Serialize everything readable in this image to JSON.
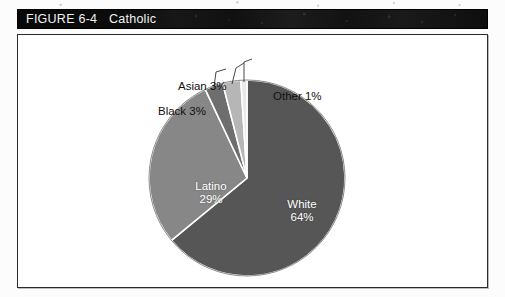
{
  "header": {
    "figure_number": "FIGURE 6-4",
    "figure_title": "Catholic",
    "bar_color": "#101010",
    "text_color": "#f2f2f2"
  },
  "frame": {
    "background": "#ffffff",
    "border_color": "#2b2b2b"
  },
  "chart_data": {
    "type": "pie",
    "title": "Catholic",
    "xlabel": "",
    "ylabel": "",
    "categories": [
      "White",
      "Latino",
      "Black",
      "Asian",
      "Other"
    ],
    "values": [
      64,
      29,
      3,
      3,
      1
    ],
    "unit": "percent",
    "legend": "none",
    "grid": false,
    "start_angle_deg": 0,
    "direction": "clockwise",
    "slices": [
      {
        "name": "White",
        "label": "White",
        "value_label": "64%",
        "value": 64,
        "color": "#565656",
        "label_position": "inside",
        "label_color": "#ffffff"
      },
      {
        "name": "Latino",
        "label": "Latino",
        "value_label": "29%",
        "value": 29,
        "color": "#878787",
        "label_position": "inside",
        "label_color": "#ffffff"
      },
      {
        "name": "Black",
        "label": "Black 3%",
        "value_label": "3%",
        "value": 3,
        "color": "#6e6e6e",
        "label_position": "outside",
        "label_color": "#111111"
      },
      {
        "name": "Asian",
        "label": "Asian 3%",
        "value_label": "3%",
        "value": 3,
        "color": "#b6b6b6",
        "label_position": "outside",
        "label_color": "#111111"
      },
      {
        "name": "Other",
        "label": "Other 1%",
        "value_label": "1%",
        "value": 1,
        "color": "#e9e9e9",
        "label_position": "outside",
        "label_color": "#111111"
      }
    ]
  },
  "labels": {
    "white_name": "White",
    "white_pct": "64%",
    "latino_name": "Latino",
    "latino_pct": "29%",
    "asian": "Asian 3%",
    "black": "Black 3%",
    "other": "Other 1%"
  }
}
